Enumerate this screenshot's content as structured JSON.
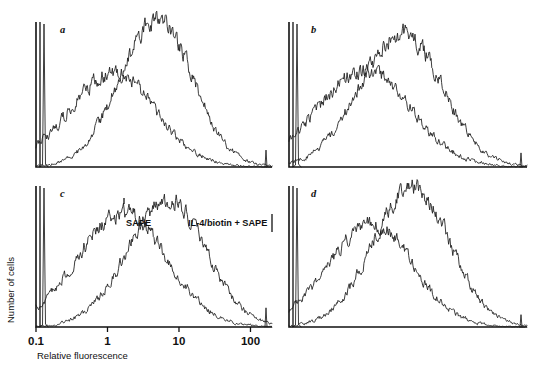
{
  "figure": {
    "type": "flow-cytometry-histogram-panel",
    "background": "#ffffff",
    "trace_color": "#1a1a1a",
    "axis_color": "#111111",
    "y_axis_label": "Number of cells",
    "x_axis_label": "Relative fluorescence",
    "x_tick_labels": [
      "0.1",
      "1",
      "10",
      "100"
    ],
    "x_tick_values": [
      0.1,
      1,
      10,
      100
    ],
    "curve_labels": {
      "control": "SAPE",
      "stained": "IL-4/biotin + SAPE"
    },
    "panels": [
      {
        "letter": "a"
      },
      {
        "letter": "b"
      },
      {
        "letter": "c"
      },
      {
        "letter": "d"
      }
    ]
  },
  "chart_data": {
    "type": "line",
    "title": "",
    "xlabel": "Relative fluorescence",
    "ylabel": "Number of cells",
    "xscale": "log",
    "xlim": [
      0.1,
      200
    ],
    "ylim": [
      0,
      100
    ],
    "grid": false,
    "legend_position": "inside-top-center",
    "xticks": [
      0.1,
      1,
      10,
      100
    ],
    "xticklabels": [
      "0.1",
      "1",
      "10",
      "100"
    ],
    "panels": [
      {
        "letter": "a",
        "series": [
          {
            "name": "SAPE",
            "peak_x": 1.1,
            "peak_y": 62,
            "width_decades": 0.62,
            "values": [
              2,
              5,
              12,
              24,
              38,
              52,
              60,
              62,
              58,
              48,
              34,
              22,
              13,
              7,
              4,
              2,
              1,
              0,
              0,
              0
            ]
          },
          {
            "name": "IL-4/biotin + SAPE",
            "peak_x": 4.6,
            "peak_y": 97,
            "width_decades": 0.52,
            "values": [
              0,
              0,
              0,
              1,
              3,
              8,
              20,
              40,
              66,
              88,
              97,
              90,
              72,
              50,
              30,
              16,
              8,
              4,
              2,
              1
            ]
          }
        ],
        "edge_spike_left": 100,
        "edge_spike_right": 12
      },
      {
        "letter": "b",
        "series": [
          {
            "name": "SAPE",
            "peak_x": 1.05,
            "peak_y": 64,
            "width_decades": 0.66,
            "values": [
              3,
              7,
              14,
              26,
              40,
              54,
              62,
              64,
              59,
              50,
              37,
              25,
              15,
              9,
              5,
              3,
              1,
              1,
              0,
              0
            ]
          },
          {
            "name": "IL-4/biotin + SAPE",
            "peak_x": 3.4,
            "peak_y": 88,
            "width_decades": 0.58,
            "values": [
              0,
              0,
              1,
              2,
              5,
              12,
              26,
              46,
              70,
              86,
              88,
              78,
              60,
              41,
              25,
              14,
              7,
              3,
              1,
              0
            ]
          }
        ],
        "edge_spike_left": 100,
        "edge_spike_right": 10
      },
      {
        "letter": "c",
        "series": [
          {
            "name": "SAPE",
            "peak_x": 1.5,
            "peak_y": 78,
            "width_decades": 0.64,
            "values": [
              2,
              6,
              14,
              28,
              44,
              60,
              72,
              78,
              74,
              63,
              48,
              33,
              20,
              11,
              6,
              3,
              1,
              0,
              0,
              0
            ]
          },
          {
            "name": "IL-4/biotin + SAPE",
            "peak_x": 6.5,
            "peak_y": 86,
            "width_decades": 0.56,
            "values": [
              0,
              0,
              0,
              1,
              3,
              9,
              22,
              42,
              66,
              83,
              86,
              80,
              64,
              45,
              28,
              15,
              8,
              4,
              2,
              1
            ]
          }
        ],
        "edge_spike_left": 100,
        "edge_spike_right": 14
      },
      {
        "letter": "d",
        "series": [
          {
            "name": "SAPE",
            "peak_x": 1.3,
            "peak_y": 70,
            "width_decades": 0.6,
            "values": [
              2,
              6,
              13,
              26,
              41,
              56,
              66,
              70,
              66,
              56,
              42,
              28,
              17,
              9,
              5,
              2,
              1,
              0,
              0,
              0
            ]
          },
          {
            "name": "IL-4/biotin + SAPE",
            "peak_x": 4.8,
            "peak_y": 95,
            "width_decades": 0.54,
            "values": [
              0,
              0,
              0,
              1,
              3,
              9,
              21,
              42,
              68,
              89,
              95,
              88,
              70,
              48,
              29,
              15,
              7,
              3,
              1,
              0
            ]
          }
        ],
        "edge_spike_left": 100,
        "edge_spike_right": 9
      }
    ]
  }
}
